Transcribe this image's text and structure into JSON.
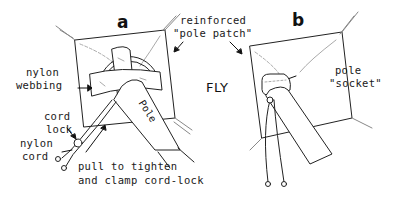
{
  "diagram": {
    "panels": [
      {
        "id": "a",
        "label": "a"
      },
      {
        "id": "b",
        "label": "b"
      }
    ],
    "labels": {
      "reinforced_line1": "reinforced",
      "reinforced_line2": "\"pole patch\"",
      "nylon_webbing_line1": "nylon",
      "nylon_webbing_line2": "webbing",
      "fly": "FLY",
      "pole": "Pole",
      "cord_lock_line1": "cord",
      "cord_lock_line2": "lock",
      "nylon_cord_line1": "nylon",
      "nylon_cord_line2": "cord",
      "pull_line1": "pull to tighten",
      "pull_line2": "and clamp cord-lock",
      "pole_socket_line1": "pole",
      "pole_socket_line2": "\"socket\""
    },
    "colors": {
      "ink": "#1a1a1a",
      "shading": "#9a9a9a",
      "background": "#ffffff"
    }
  }
}
